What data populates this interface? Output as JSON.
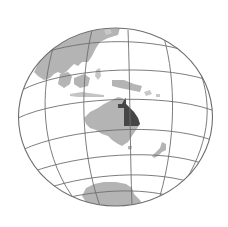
{
  "map": {
    "projection": "orthographic",
    "title": "Queensland, Australia locator globe",
    "highlighted_region": "Queensland",
    "visible_landmasses": [
      "Asia (Southeast)",
      "Maritime Southeast Asia",
      "Australia",
      "New Zealand",
      "Antarctica"
    ],
    "colors": {
      "background": "#ffffff",
      "ocean": "#ffffff",
      "land": "#b4b4b4",
      "highlight": "#464646",
      "graticule": "#6e6e6e"
    }
  }
}
